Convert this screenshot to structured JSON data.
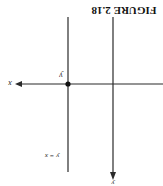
{
  "figure": {
    "caption": "FIGURE 2.18",
    "orientation": "rotated 180 degrees",
    "labels": {
      "horizontal_axis": "x",
      "vertical_axis": "y",
      "point": "y",
      "line": "y = x"
    },
    "colors": {
      "line": "#2a2a2a",
      "background": "#ffffff"
    }
  }
}
